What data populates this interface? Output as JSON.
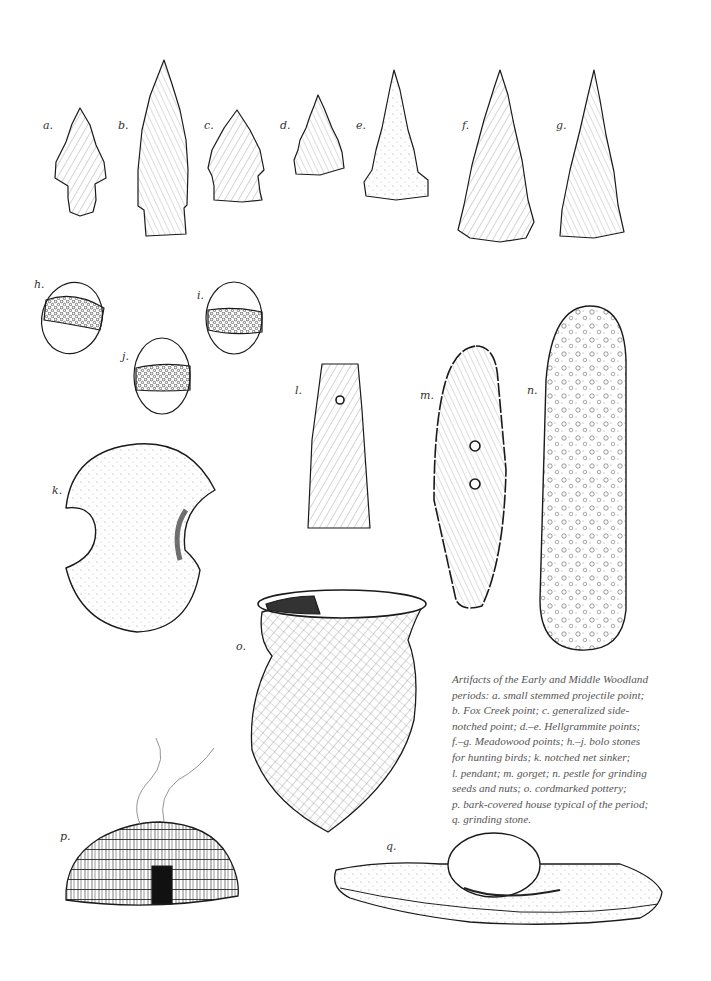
{
  "labels": {
    "a": "a.",
    "b": "b.",
    "c": "c.",
    "d": "d.",
    "e": "e.",
    "f": "f.",
    "g": "g.",
    "h": "h.",
    "i": "i.",
    "j": "j.",
    "k": "k.",
    "l": "l.",
    "m": "m.",
    "n": "n.",
    "o": "o.",
    "p": "p.",
    "q": "q."
  },
  "caption": {
    "lines": [
      "Artifacts of the Early and Middle Woodland",
      "periods: a. small stemmed projectile point;",
      "b. Fox Creek point; c. generalized side-",
      "notched point; d.–e. Hellgrammite points;",
      "f.–g.  Meadowood points; h.–j. bolo stones",
      "for hunting birds; k. notched net sinker;",
      "l. pendant; m. gorget; n. pestle for grinding",
      "seeds and nuts; o. cordmarked pottery;",
      "p. bark-covered house typical of the period;",
      "q. grinding stone."
    ]
  },
  "artifacts": [
    {
      "id": "a",
      "name": "small stemmed projectile point"
    },
    {
      "id": "b",
      "name": "Fox Creek point"
    },
    {
      "id": "c",
      "name": "generalized side-notched point"
    },
    {
      "id": "d",
      "name": "Hellgrammite point"
    },
    {
      "id": "e",
      "name": "Hellgrammite point"
    },
    {
      "id": "f",
      "name": "Meadowood point"
    },
    {
      "id": "g",
      "name": "Meadowood point"
    },
    {
      "id": "h",
      "name": "bolo stone"
    },
    {
      "id": "i",
      "name": "bolo stone"
    },
    {
      "id": "j",
      "name": "bolo stone"
    },
    {
      "id": "k",
      "name": "notched net sinker"
    },
    {
      "id": "l",
      "name": "pendant"
    },
    {
      "id": "m",
      "name": "gorget"
    },
    {
      "id": "n",
      "name": "pestle"
    },
    {
      "id": "o",
      "name": "cordmarked pottery"
    },
    {
      "id": "p",
      "name": "bark-covered house"
    },
    {
      "id": "q",
      "name": "grinding stone"
    }
  ],
  "colors": {
    "ink": "#1a1a1a",
    "paper": "#ffffff",
    "caption": "#555555"
  }
}
